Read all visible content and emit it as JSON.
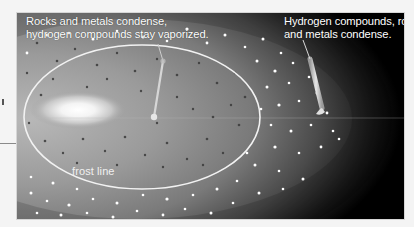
{
  "figure": {
    "labels": {
      "inner_region": {
        "line1": "Rocks and metals condense,",
        "line2": "hydrogen compounds stay vaporized."
      },
      "outer_region": {
        "line1": "Hydrogen compounds, rocks,",
        "line2": "and metals condense."
      },
      "frost_line": "frost line"
    },
    "colors": {
      "background": "#000000",
      "page": "#f4f4f4",
      "frost_line": "#f2f2f2",
      "text": "#ffffff",
      "pointer": "#d0d0d0"
    }
  }
}
